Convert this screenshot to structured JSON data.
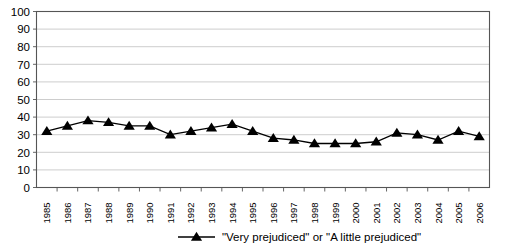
{
  "chart_data": {
    "type": "line",
    "title": "",
    "subtitle": "",
    "xlabel": "",
    "ylabel": "",
    "ylim": [
      0,
      100
    ],
    "ytick_labels": [
      "100",
      "90",
      "80",
      "70",
      "60",
      "50",
      "40",
      "30",
      "20",
      "10",
      "0"
    ],
    "ytick_values": [
      100,
      90,
      80,
      70,
      60,
      50,
      40,
      30,
      20,
      10,
      0
    ],
    "grid": true,
    "grid_axis": "y",
    "legend_position": "bottom",
    "marker": "triangle-up",
    "categories": [
      "1985",
      "1986",
      "1987",
      "1988",
      "1989",
      "1990",
      "1991",
      "1992",
      "1993",
      "1994",
      "1995",
      "1996",
      "1997",
      "1998",
      "1999",
      "2000",
      "2001",
      "2002",
      "2003",
      "2004",
      "2005",
      "2006"
    ],
    "series": [
      {
        "name": "\"Very prejudiced\" or \"A little prejudiced\"",
        "values": [
          32,
          35,
          38,
          37,
          35,
          35,
          30,
          32,
          34,
          36,
          32,
          28,
          27,
          25,
          25,
          25,
          26,
          31,
          30,
          27,
          32,
          29
        ]
      }
    ],
    "colors": {
      "series": "#000000",
      "gridline": "#b8b8b8",
      "axis": "#555555",
      "text": "#000000",
      "background": "#ffffff"
    }
  }
}
